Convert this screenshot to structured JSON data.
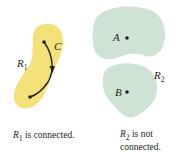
{
  "figure": {
    "colors": {
      "region1_fill": "#f3e27a",
      "region2_fill": "#cfe3d5",
      "ink": "#231f20",
      "background": "#ffffff"
    },
    "region1": {
      "label": "R",
      "label_sub": "1",
      "curve_label": "C",
      "caption_var": "R",
      "caption_sub": "1",
      "caption_text": " is connected."
    },
    "region2": {
      "label": "R",
      "label_sub": "2",
      "point_a": "A",
      "point_b": "B",
      "caption_var": "R",
      "caption_sub": "2",
      "caption_line1": " is not",
      "caption_line2": "connected."
    }
  }
}
